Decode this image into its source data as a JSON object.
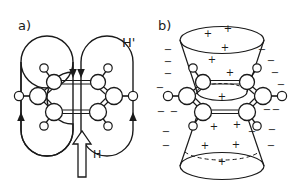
{
  "figure": {
    "background": "#ffffff",
    "stroke": "#1a1a1a",
    "panels": [
      {
        "id": "a",
        "label": "a)",
        "label_x": 18,
        "label_y": 30,
        "caption_role": "ring-current-induced-field",
        "field_label": "H'",
        "field_label_x": 122,
        "field_label_y": 47,
        "applied_field_label": "H",
        "applied_field_label_x": 96,
        "applied_field_label_y": 158,
        "applied_field_arrow": {
          "direction": "up",
          "x": 82,
          "y_tail": 177,
          "y_head": 131,
          "shaft_half_width": 4,
          "head_half_width": 9,
          "head_height": 13
        },
        "loops": [
          {
            "name": "left-field-loop",
            "cx": 47,
            "cy": 96,
            "rx": 28,
            "ry": 52,
            "arrow_down_x": 73,
            "arrow_down_y": 62,
            "arrow_up_x": 22,
            "arrow_up_y": 127
          },
          {
            "name": "right-field-loop",
            "cx": 106,
            "cy": 96,
            "rx": 28,
            "ry": 52,
            "arrow_down_x": 81,
            "arrow_down_y": 62,
            "arrow_up_x": 132,
            "arrow_up_y": 127
          }
        ]
      },
      {
        "id": "b",
        "label": "b)",
        "label_x": 158,
        "label_y": 30,
        "caption_role": "anisotropy-shielding-cones",
        "cones": [
          {
            "name": "upper-cone",
            "apex_y": 92,
            "rim_y": 40,
            "rim_rx": 42,
            "rim_ry": 14,
            "waist_rx": 26,
            "hidden_arc": "none"
          },
          {
            "name": "lower-cone",
            "apex_y": 116,
            "rim_y": 166,
            "rim_rx": 42,
            "rim_ry": 14,
            "waist_rx": 26,
            "hidden_arc": "dashed-back"
          }
        ],
        "plus_signs": [
          {
            "x": 208,
            "y": 33
          },
          "",
          {
            "x": 228,
            "y": 29
          },
          {
            "x": 225,
            "y": 48
          },
          {
            "x": 212,
            "y": 60
          },
          {
            "x": 230,
            "y": 73
          },
          {
            "x": 222,
            "y": 97
          },
          {
            "x": 214,
            "y": 127
          },
          {
            "x": 237,
            "y": 125
          },
          {
            "x": 205,
            "y": 146
          },
          {
            "x": 236,
            "y": 145
          },
          {
            "x": 222,
            "y": 162
          }
        ],
        "minus_signs": [
          {
            "x": 168,
            "y": 50
          },
          {
            "x": 168,
            "y": 62
          },
          {
            "x": 168,
            "y": 74
          },
          {
            "x": 160,
            "y": 88
          },
          {
            "x": 161,
            "y": 112
          },
          {
            "x": 172,
            "y": 112
          },
          {
            "x": 166,
            "y": 132
          },
          {
            "x": 166,
            "y": 146
          },
          {
            "x": 262,
            "y": 50
          },
          {
            "x": 271,
            "y": 61
          },
          {
            "x": 275,
            "y": 73
          },
          {
            "x": 281,
            "y": 85
          },
          {
            "x": 276,
            "y": 110
          },
          {
            "x": 267,
            "y": 110
          },
          {
            "x": 272,
            "y": 130
          },
          {
            "x": 271,
            "y": 146
          },
          {
            "x": 252,
            "y": 132
          }
        ]
      }
    ],
    "molecule": {
      "name": "benzene",
      "depiction": "3d-perspective-ball-and-stick",
      "ring_bonds": "double-lines",
      "atom_count_carbon": 6,
      "atom_count_hydrogen": 6
    }
  }
}
